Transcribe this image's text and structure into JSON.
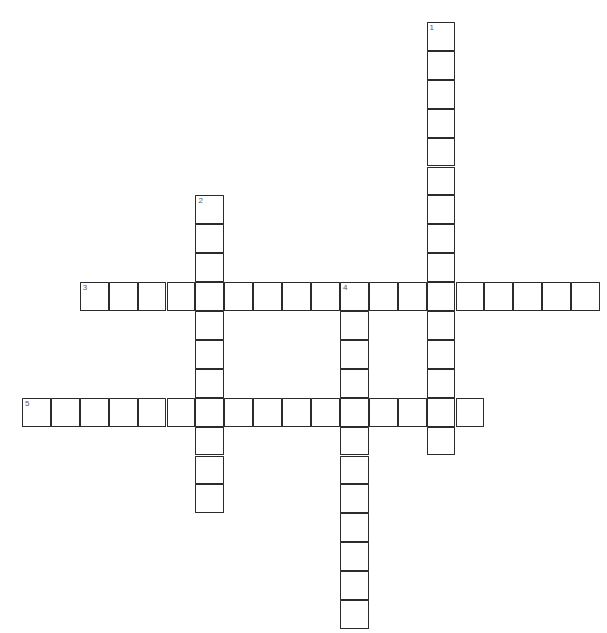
{
  "page": {
    "header_note": "",
    "background_color": "#ffffff",
    "grid_line_color": "#2b2b2b",
    "cell_fill_color": "#ffffff",
    "number_color": "#555555"
  },
  "grid": {
    "cell_size": 28.9,
    "origin_x": 22,
    "origin_y": 22,
    "columns": 20,
    "rows": 21,
    "border_width": 1.6
  },
  "entries": [
    {
      "number": 1,
      "direction": "down",
      "label": "1",
      "start_col": 14,
      "start_row": 0,
      "length": 15,
      "letters": [
        "",
        "",
        "",
        "",
        "",
        "",
        "",
        "",
        "",
        "",
        "",
        "",
        "",
        "",
        ""
      ]
    },
    {
      "number": 2,
      "direction": "down",
      "label": "2",
      "start_col": 6,
      "start_row": 6,
      "length": 11,
      "letters": [
        "",
        "",
        "",
        "",
        "",
        "",
        "",
        "",
        "",
        "",
        ""
      ]
    },
    {
      "number": 3,
      "direction": "across",
      "label": "3",
      "start_col": 2,
      "start_row": 9,
      "length": 18,
      "letters": [
        "",
        "",
        "",
        "",
        "",
        "",
        "",
        "",
        "",
        "",
        "",
        "",
        "",
        "",
        "",
        "",
        "",
        ""
      ]
    },
    {
      "number": 4,
      "direction": "down",
      "label": "4",
      "start_col": 11,
      "start_row": 9,
      "length": 12,
      "letters": [
        "",
        "",
        "",
        "",
        "",
        "",
        "",
        "",
        "",
        "",
        "",
        ""
      ]
    },
    {
      "number": 5,
      "direction": "across",
      "label": "5",
      "start_col": 0,
      "start_row": 13,
      "length": 16,
      "letters": [
        "",
        "",
        "",
        "",
        "",
        "",
        "",
        "",
        "",
        "",
        "",
        "",
        "",
        "",
        "",
        ""
      ]
    }
  ]
}
